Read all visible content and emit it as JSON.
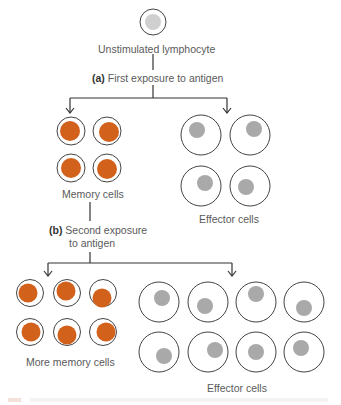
{
  "labels": {
    "top_cell": "Unstimulated lymphocyte",
    "step_a_marker": "(a)",
    "step_a_text": "First exposure to antigen",
    "memory_cells": "Memory cells",
    "effector_cells_top": "Effector cells",
    "step_b_marker": "(b)",
    "step_b_text_line1": "Second exposure",
    "step_b_text_line2": "to antigen",
    "more_memory_cells": "More memory cells",
    "effector_cells_bottom": "Effector cells"
  },
  "colors": {
    "line": "#333333",
    "cell_outline": "#444444",
    "memory_nucleus": "#d2611c",
    "effector_nucleus": "#a9a9a9",
    "unstimulated_nucleus": "#cfcfcf"
  },
  "cells": {
    "unstimulated": {
      "cx": 153,
      "cy": 22,
      "r": 13,
      "nx": 153,
      "ny": 22,
      "nr": 8
    },
    "memory_top": [
      {
        "cx": 71,
        "cy": 131,
        "r": 14,
        "nx": 70,
        "ny": 131,
        "nr": 10
      },
      {
        "cx": 107,
        "cy": 131,
        "r": 14,
        "nx": 109,
        "ny": 132,
        "nr": 10
      },
      {
        "cx": 71,
        "cy": 168,
        "r": 14,
        "nx": 71,
        "ny": 168,
        "nr": 10
      },
      {
        "cx": 107,
        "cy": 168,
        "r": 14,
        "nx": 107,
        "ny": 169,
        "nr": 10
      }
    ],
    "effector_top": [
      {
        "cx": 201,
        "cy": 135,
        "r": 20,
        "nx": 197,
        "ny": 130,
        "nr": 8
      },
      {
        "cx": 250,
        "cy": 135,
        "r": 20,
        "nx": 254,
        "ny": 129,
        "nr": 8
      },
      {
        "cx": 201,
        "cy": 186,
        "r": 20,
        "nx": 205,
        "ny": 183,
        "nr": 8
      },
      {
        "cx": 250,
        "cy": 186,
        "r": 20,
        "nx": 246,
        "ny": 187,
        "nr": 8
      }
    ],
    "memory_bottom": [
      {
        "cx": 30,
        "cy": 293,
        "r": 13.5,
        "nx": 28,
        "ny": 293,
        "nr": 9.5
      },
      {
        "cx": 67,
        "cy": 293,
        "r": 13.5,
        "nx": 66,
        "ny": 291,
        "nr": 9.5
      },
      {
        "cx": 103,
        "cy": 293,
        "r": 13.5,
        "nx": 102,
        "ny": 298,
        "nr": 9.5
      },
      {
        "cx": 30,
        "cy": 332,
        "r": 13.5,
        "nx": 31,
        "ny": 332,
        "nr": 9.5
      },
      {
        "cx": 67,
        "cy": 332,
        "r": 13.5,
        "nx": 67,
        "ny": 335,
        "nr": 9.5
      },
      {
        "cx": 103,
        "cy": 332,
        "r": 13.5,
        "nx": 106,
        "ny": 332,
        "nr": 9.5
      }
    ],
    "effector_bottom": [
      {
        "cx": 159,
        "cy": 302,
        "r": 20,
        "nx": 162,
        "ny": 298,
        "nr": 8
      },
      {
        "cx": 208,
        "cy": 302,
        "r": 20,
        "nx": 205,
        "ny": 306,
        "nr": 8
      },
      {
        "cx": 256,
        "cy": 302,
        "r": 20,
        "nx": 256,
        "ny": 294,
        "nr": 8
      },
      {
        "cx": 304,
        "cy": 302,
        "r": 20,
        "nx": 304,
        "ny": 308,
        "nr": 8
      },
      {
        "cx": 159,
        "cy": 352,
        "r": 20,
        "nx": 164,
        "ny": 356,
        "nr": 8
      },
      {
        "cx": 208,
        "cy": 352,
        "r": 20,
        "nx": 215,
        "ny": 350,
        "nr": 8
      },
      {
        "cx": 256,
        "cy": 352,
        "r": 20,
        "nx": 256,
        "ny": 352,
        "nr": 8
      },
      {
        "cx": 304,
        "cy": 352,
        "r": 20,
        "nx": 301,
        "ny": 348,
        "nr": 8
      }
    ]
  },
  "connectors": {
    "a": {
      "stem_x": 153,
      "stem_y1": 54,
      "stem_y2": 70,
      "stem2_y1": 85,
      "bar_y": 98,
      "left_x": 70,
      "right_x": 227,
      "arrow_y": 113
    },
    "b": {
      "stem_x": 90,
      "stem_y1": 202,
      "stem_y2": 221,
      "stem2_y1": 252,
      "bar_y": 263,
      "left_x": 48,
      "right_x": 232,
      "arrow_y": 276
    }
  }
}
